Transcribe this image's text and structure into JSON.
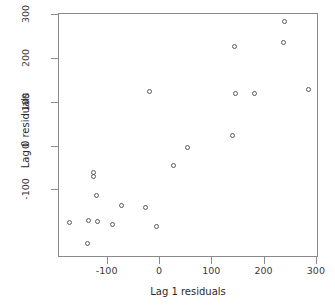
{
  "chart_data": {
    "type": "scatter",
    "title": "",
    "xlabel": "Lag 1 residuals",
    "ylabel": "Lag 0 residuals",
    "xlim": [
      -193,
      304
    ],
    "ylim": [
      -254,
      302
    ],
    "xticks": [
      -100,
      0,
      100,
      200,
      300
    ],
    "yticks": [
      -100,
      0,
      100,
      200,
      300
    ],
    "xtick_labels": [
      "-100",
      "0",
      "100",
      "200",
      "300"
    ],
    "ytick_labels": [
      "-100",
      "0",
      "100",
      "200",
      "300"
    ],
    "grid": false,
    "legend": null,
    "marker": "open-circle",
    "marker_color": "#5a5a5a",
    "n_points": 21,
    "points": [
      {
        "x": -173,
        "y": -173
      },
      {
        "x": -138,
        "y": -220
      },
      {
        "x": -136,
        "y": -168
      },
      {
        "x": -128,
        "y": -59
      },
      {
        "x": -128,
        "y": -68
      },
      {
        "x": -121,
        "y": -111
      },
      {
        "x": -119,
        "y": -170
      },
      {
        "x": -91,
        "y": -177
      },
      {
        "x": -73,
        "y": -134
      },
      {
        "x": -28,
        "y": -139
      },
      {
        "x": -20,
        "y": 125
      },
      {
        "x": -7,
        "y": -182
      },
      {
        "x": 26,
        "y": -43
      },
      {
        "x": 52,
        "y": -2
      },
      {
        "x": 138,
        "y": 25
      },
      {
        "x": 143,
        "y": 229
      },
      {
        "x": 145,
        "y": 120
      },
      {
        "x": 236,
        "y": 236
      },
      {
        "x": 238,
        "y": 284
      },
      {
        "x": 283,
        "y": 130
      },
      {
        "x": 180,
        "y": 120
      }
    ]
  },
  "axes": {
    "box_color": "#8a8a8a",
    "tick_color": "#8a8a8a",
    "text_color": "#3a3a3a"
  }
}
